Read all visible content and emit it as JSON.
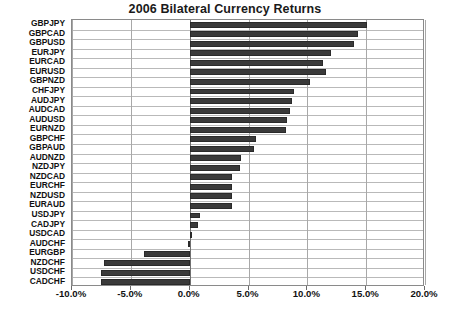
{
  "chart_data": {
    "type": "bar",
    "orientation": "horizontal",
    "title": "2006 Bilateral Currency Returns",
    "xlabel": "",
    "ylabel": "",
    "xlim": [
      -10.0,
      20.0
    ],
    "xtick_labels": [
      "-10.0%",
      "-5.0%",
      "0.0%",
      "5.0%",
      "10.0%",
      "15.0%",
      "20.0%"
    ],
    "xtick_values": [
      -10.0,
      -5.0,
      0.0,
      5.0,
      10.0,
      15.0,
      20.0
    ],
    "grid": true,
    "legend": false,
    "bar_color": "#3a3a3a",
    "categories": [
      "GBPJPY",
      "GBPCAD",
      "GBPUSD",
      "EURJPY",
      "EURCAD",
      "EURUSD",
      "GBPNZD",
      "CHFJPY",
      "AUDJPY",
      "AUDCAD",
      "AUDUSD",
      "EURNZD",
      "GBPCHF",
      "GBPAUD",
      "AUDNZD",
      "NZDJPY",
      "NZDCAD",
      "EURCHF",
      "NZDUSD",
      "EURAUD",
      "USDJPY",
      "CADJPY",
      "USDCAD",
      "AUDCHF",
      "EURGBP",
      "NZDCHF",
      "USDCHF",
      "CADCHF"
    ],
    "values": [
      15.1,
      14.3,
      14.0,
      12.0,
      11.3,
      11.6,
      10.2,
      8.9,
      8.7,
      8.5,
      8.3,
      8.2,
      5.6,
      5.5,
      4.4,
      4.3,
      3.6,
      3.6,
      3.6,
      3.6,
      0.9,
      0.7,
      0.1,
      -0.1,
      -3.9,
      -7.3,
      -7.5,
      -7.5
    ]
  }
}
